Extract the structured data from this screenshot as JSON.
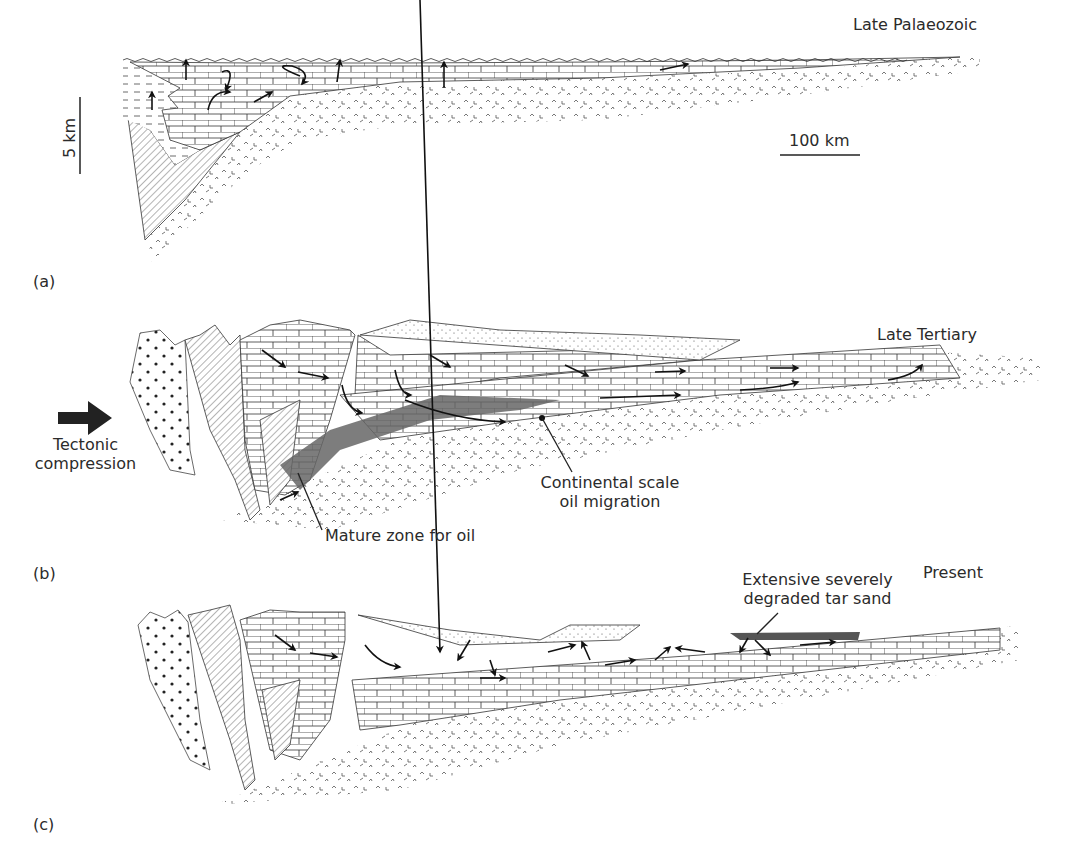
{
  "figure": {
    "panels": [
      {
        "id": "(a)",
        "title": "Late Palaeozoic",
        "scale_vertical": "5 km",
        "scale_horizontal": "100 km"
      },
      {
        "id": "(b)",
        "title": "Late Tertiary",
        "arrow_label_line1": "Tectonic",
        "arrow_label_line2": "compression",
        "annotation_migration_line1": "Continental scale",
        "annotation_migration_line2": "oil migration",
        "annotation_mature": "Mature zone for oil"
      },
      {
        "id": "(c)",
        "title": "Present",
        "annotation_tar_line1": "Extensive severely",
        "annotation_tar_line2": "degraded tar sand"
      }
    ],
    "colors": {
      "ink": "#231f20",
      "oil_zone": "#555555",
      "background": "#ffffff"
    }
  }
}
